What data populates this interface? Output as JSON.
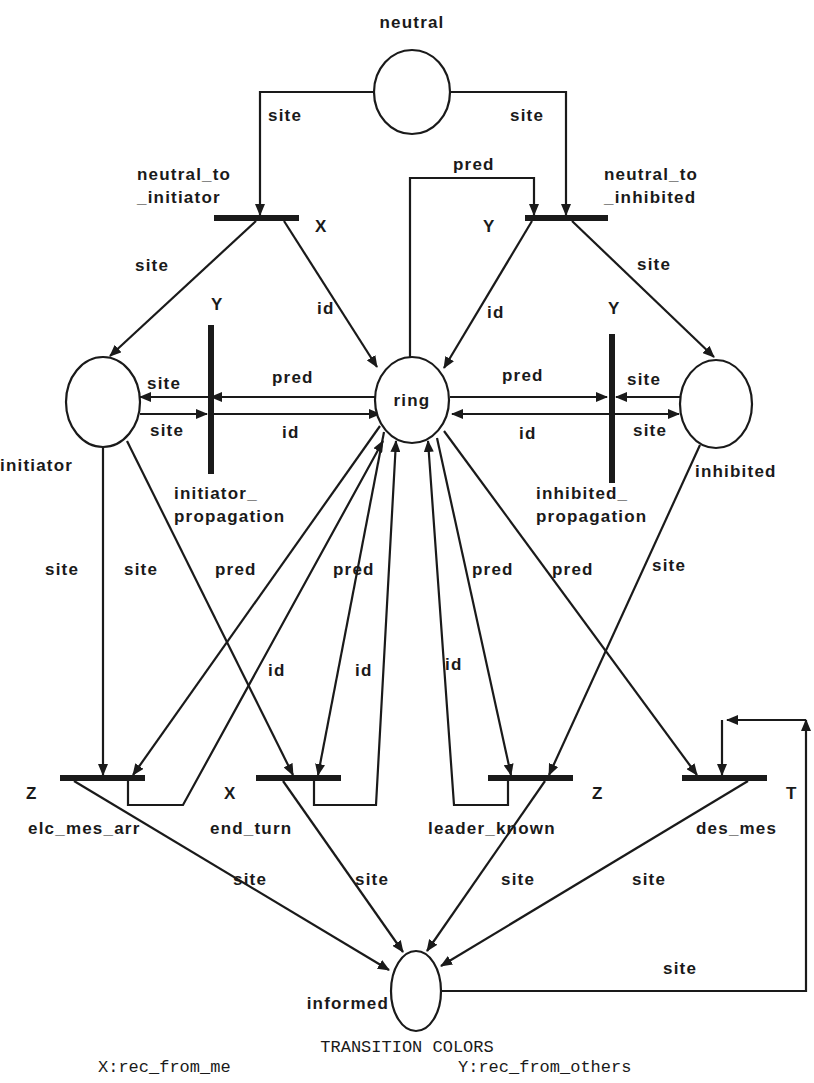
{
  "diagram": {
    "type": "colored-petri-net",
    "places": [
      {
        "id": "neutral",
        "label": "neutral",
        "cx": 412,
        "cy": 92,
        "rx": 38,
        "ry": 42,
        "lx": 412,
        "ly": 28,
        "anchor": "middle"
      },
      {
        "id": "initiator",
        "label": "initiator",
        "cx": 103,
        "cy": 402,
        "rx": 37,
        "ry": 45,
        "lx": 0,
        "ly": 471,
        "anchor": "start"
      },
      {
        "id": "ring",
        "label": "ring",
        "cx": 412,
        "cy": 400,
        "rx": 37,
        "ry": 43,
        "lx": 412,
        "ly": 406,
        "anchor": "middle"
      },
      {
        "id": "inhibited",
        "label": "inhibited",
        "cx": 716,
        "cy": 404,
        "rx": 36,
        "ry": 44,
        "lx": 695,
        "ly": 477,
        "anchor": "start"
      },
      {
        "id": "informed",
        "label": "informed",
        "cx": 416,
        "cy": 991,
        "rx": 25,
        "ry": 40,
        "lx": 389,
        "ly": 1009,
        "anchor": "end"
      }
    ],
    "transitions": [
      {
        "id": "neutral_to_initiator",
        "label_lines": [
          "neutral_to",
          "_initiator"
        ],
        "x": 214,
        "y": 215,
        "w": 85,
        "h": 6,
        "lx": 137,
        "ly": 180,
        "color": "X",
        "cx": 315,
        "cy": 232
      },
      {
        "id": "neutral_to_inhibited",
        "label_lines": [
          "neutral_to",
          "_inhibited"
        ],
        "x": 525,
        "y": 215,
        "w": 83,
        "h": 6,
        "lx": 604,
        "ly": 180,
        "color": "Y",
        "cx": 483,
        "cy": 232
      },
      {
        "id": "initiator_propagation",
        "label_lines": [
          "initiator_",
          "propagation"
        ],
        "x": 208,
        "y": 325,
        "w": 6,
        "h": 149,
        "lx": 174,
        "ly": 499,
        "color": "Y",
        "cx": 211,
        "cy": 310
      },
      {
        "id": "inhibited_propagation",
        "label_lines": [
          "inhibited_",
          "propagation"
        ],
        "x": 609,
        "y": 334,
        "w": 6,
        "h": 149,
        "lx": 536,
        "ly": 499,
        "color": "Y",
        "cx": 608,
        "cy": 314
      },
      {
        "id": "elc_mes_arr",
        "label_lines": [
          "elc_mes_arr"
        ],
        "x": 60,
        "y": 775,
        "w": 85,
        "h": 6,
        "lx": 28,
        "ly": 834,
        "color": "Z",
        "cx": 26,
        "cy": 799
      },
      {
        "id": "end_turn",
        "label_lines": [
          "end_turn"
        ],
        "x": 256,
        "y": 775,
        "w": 85,
        "h": 6,
        "lx": 210,
        "ly": 834,
        "color": "X",
        "cx": 224,
        "cy": 799
      },
      {
        "id": "leader_known",
        "label_lines": [
          "leader_known"
        ],
        "x": 488,
        "y": 775,
        "w": 85,
        "h": 6,
        "lx": 428,
        "ly": 834,
        "color": "Z",
        "cx": 592,
        "cy": 799
      },
      {
        "id": "des_mes",
        "label_lines": [
          "des_mes"
        ],
        "x": 682,
        "y": 775,
        "w": 85,
        "h": 6,
        "lx": 696,
        "ly": 834,
        "color": "T",
        "cx": 786,
        "cy": 799
      }
    ],
    "arcs": [
      {
        "label": "site",
        "points": [
          [
            374,
            92
          ],
          [
            260,
            92
          ],
          [
            260,
            215
          ]
        ],
        "arrow": "end",
        "lx": 268,
        "ly": 121
      },
      {
        "label": "site",
        "points": [
          [
            450,
            92
          ],
          [
            566,
            92
          ],
          [
            566,
            215
          ]
        ],
        "arrow": "end",
        "lx": 510,
        "ly": 121
      },
      {
        "label": "pred",
        "points": [
          [
            410,
            357
          ],
          [
            410,
            178
          ],
          [
            534,
            178
          ],
          [
            534,
            215
          ]
        ],
        "arrow": "end",
        "lx": 453,
        "ly": 170
      },
      {
        "label": "site",
        "points": [
          [
            256,
            221
          ],
          [
            110,
            356
          ]
        ],
        "arrow": "end",
        "lx": 135,
        "ly": 271
      },
      {
        "label": "id",
        "points": [
          [
            284,
            221
          ],
          [
            377,
            367
          ]
        ],
        "arrow": "end",
        "lx": 317,
        "ly": 314
      },
      {
        "label": "id",
        "points": [
          [
            532,
            221
          ],
          [
            444,
            368
          ]
        ],
        "arrow": "end",
        "lx": 487,
        "ly": 318
      },
      {
        "label": "site",
        "points": [
          [
            572,
            221
          ],
          [
            714,
            357
          ]
        ],
        "arrow": "end",
        "lx": 637,
        "ly": 270
      },
      {
        "label": "pred",
        "points": [
          [
            375,
            397
          ],
          [
            211,
            397
          ]
        ],
        "arrow": "end",
        "lx": 272,
        "ly": 383
      },
      {
        "label": "site",
        "points": [
          [
            208,
            397
          ],
          [
            140,
            397
          ]
        ],
        "arrow": "end",
        "lx": 147,
        "ly": 389
      },
      {
        "label": "site",
        "points": [
          [
            140,
            414
          ],
          [
            207,
            414
          ]
        ],
        "arrow": "end",
        "lx": 150,
        "ly": 436
      },
      {
        "label": "id",
        "points": [
          [
            214,
            414
          ],
          [
            380,
            414
          ]
        ],
        "arrow": "end",
        "lx": 282,
        "ly": 438
      },
      {
        "label": "pred",
        "points": [
          [
            450,
            397
          ],
          [
            607,
            397
          ]
        ],
        "arrow": "end",
        "lx": 502,
        "ly": 381
      },
      {
        "label": "site",
        "points": [
          [
            680,
            397
          ],
          [
            616,
            397
          ]
        ],
        "arrow": "end",
        "lx": 627,
        "ly": 385
      },
      {
        "label": "id",
        "points": [
          [
            609,
            414
          ],
          [
            452,
            414
          ]
        ],
        "arrow": "end",
        "lx": 519,
        "ly": 439
      },
      {
        "label": "site",
        "points": [
          [
            615,
            414
          ],
          [
            679,
            414
          ]
        ],
        "arrow": "end",
        "lx": 633,
        "ly": 436
      },
      {
        "label": "site",
        "points": [
          [
            103,
            447
          ],
          [
            103,
            775
          ]
        ],
        "arrow": "end",
        "lx": 45,
        "ly": 575
      },
      {
        "label": "site",
        "points": [
          [
            127,
            441
          ],
          [
            293,
            775
          ]
        ],
        "arrow": "end",
        "lx": 124,
        "ly": 575
      },
      {
        "label": "pred",
        "points": [
          [
            380,
            426
          ],
          [
            133,
            775
          ]
        ],
        "arrow": "end",
        "lx": 215,
        "ly": 575
      },
      {
        "label": "id",
        "points": [
          [
            128,
            781
          ],
          [
            128,
            805
          ],
          [
            183,
            805
          ],
          [
            383,
            441
          ]
        ],
        "arrow": "end",
        "lx": 268,
        "ly": 676
      },
      {
        "label": "pred",
        "points": [
          [
            384,
            432
          ],
          [
            318,
            775
          ]
        ],
        "arrow": "end",
        "lx": 333,
        "ly": 575
      },
      {
        "label": "id",
        "points": [
          [
            314,
            781
          ],
          [
            314,
            805
          ],
          [
            376,
            805
          ],
          [
            396,
            441
          ]
        ],
        "arrow": "end",
        "lx": 355,
        "ly": 676
      },
      {
        "label": "id",
        "points": [
          [
            508,
            781
          ],
          [
            508,
            805
          ],
          [
            454,
            805
          ],
          [
            428,
            441
          ]
        ],
        "arrow": "end",
        "lx": 445,
        "ly": 670
      },
      {
        "label": "pred",
        "points": [
          [
            437,
            438
          ],
          [
            511,
            775
          ]
        ],
        "arrow": "end",
        "lx": 472,
        "ly": 575
      },
      {
        "label": "pred",
        "points": [
          [
            444,
            431
          ],
          [
            697,
            775
          ]
        ],
        "arrow": "end",
        "lx": 552,
        "ly": 575
      },
      {
        "label": "site",
        "points": [
          [
            700,
            445
          ],
          [
            549,
            775
          ]
        ],
        "arrow": "end",
        "lx": 652,
        "ly": 571
      },
      {
        "label": "site",
        "points": [
          [
            74,
            781
          ],
          [
            389,
            970
          ]
        ],
        "arrow": "end",
        "lx": 233,
        "ly": 885
      },
      {
        "label": "site",
        "points": [
          [
            283,
            781
          ],
          [
            403,
            952
          ]
        ],
        "arrow": "end",
        "lx": 355,
        "ly": 885
      },
      {
        "label": "site",
        "points": [
          [
            545,
            781
          ],
          [
            427,
            951
          ]
        ],
        "arrow": "end",
        "lx": 501,
        "ly": 885
      },
      {
        "label": "site",
        "points": [
          [
            748,
            781
          ],
          [
            441,
            966
          ]
        ],
        "arrow": "end",
        "lx": 632,
        "ly": 885
      },
      {
        "label": "site",
        "points": [
          [
            442,
            991
          ],
          [
            806,
            991
          ],
          [
            806,
            720
          ]
        ],
        "arrow": "end",
        "lx": 663,
        "ly": 974
      },
      {
        "label": "",
        "points": [
          [
            806,
            720
          ],
          [
            727,
            720
          ]
        ],
        "arrow": "end",
        "lx": 0,
        "ly": 0
      },
      {
        "label": "",
        "points": [
          [
            722,
            720
          ],
          [
            722,
            775
          ]
        ],
        "arrow": "end",
        "lx": 0,
        "ly": 0
      }
    ]
  },
  "legend": {
    "title": "TRANSITION COLORS",
    "entries": [
      {
        "text": "X:rec_from_me",
        "x": 98,
        "y": 1072
      },
      {
        "text": "Y:rec_from_others",
        "x": 458,
        "y": 1072
      }
    ]
  },
  "colors": {
    "ink": "#1a1a1a",
    "background": "#ffffff"
  }
}
